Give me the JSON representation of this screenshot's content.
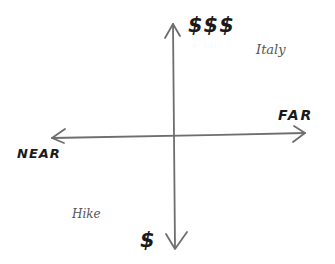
{
  "diagram": {
    "type": "quadrant",
    "colors": {
      "stroke": "#6e6e6e",
      "text": "#1a1a1a",
      "item_text": "#555555"
    },
    "axes": {
      "vertical": {
        "top_label": "$$$",
        "bottom_label": "$"
      },
      "horizontal": {
        "left_label": "NEAR",
        "right_label": "FAR"
      }
    },
    "items": [
      {
        "label": "Italy",
        "quadrant": "top-right"
      },
      {
        "label": "Hike",
        "quadrant": "bottom-left"
      }
    ]
  }
}
